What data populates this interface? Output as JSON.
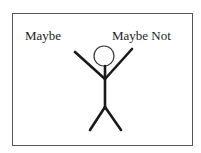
{
  "diagram": {
    "labels": {
      "left": "Maybe",
      "right": "Maybe Not"
    },
    "figure": {
      "type": "stick-figure",
      "pose": "arms-raised",
      "stroke_color": "#1a1a1a",
      "head_stroke_color": "#333333"
    },
    "frame_color": "#555555"
  }
}
